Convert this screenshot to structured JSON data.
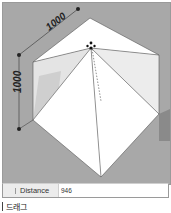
{
  "viewport": {
    "dimension_top": "1000",
    "dimension_left": "1000"
  },
  "measurements_bar": {
    "label": "Distance",
    "value": "946"
  },
  "caption": {
    "text": "드래그"
  },
  "colors": {
    "background": "#a8a8a8",
    "face_white": "#ffffff",
    "face_light": "#ececec",
    "shadow": "#8e8e8e",
    "edge": "#555555"
  }
}
